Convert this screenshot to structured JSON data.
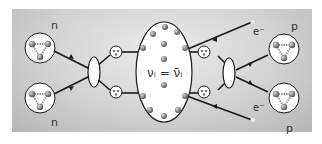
{
  "diagram": {
    "type": "neutrinoless double beta decay (Majorana) diagram",
    "labels": {
      "neutron_top": "n",
      "neutron_bottom": "n",
      "proton_top": "p",
      "proton_bottom": "p",
      "electron_top": "e⁻",
      "electron_bottom": "e⁻",
      "center_equation": "νᵢ = ν̄ᵢ"
    },
    "colors": {
      "background_light": "#ececec",
      "background_dark": "#b6b6b6",
      "line": "#1a1a1a",
      "node_fill": "#ffffff",
      "particle": "#888888"
    }
  }
}
